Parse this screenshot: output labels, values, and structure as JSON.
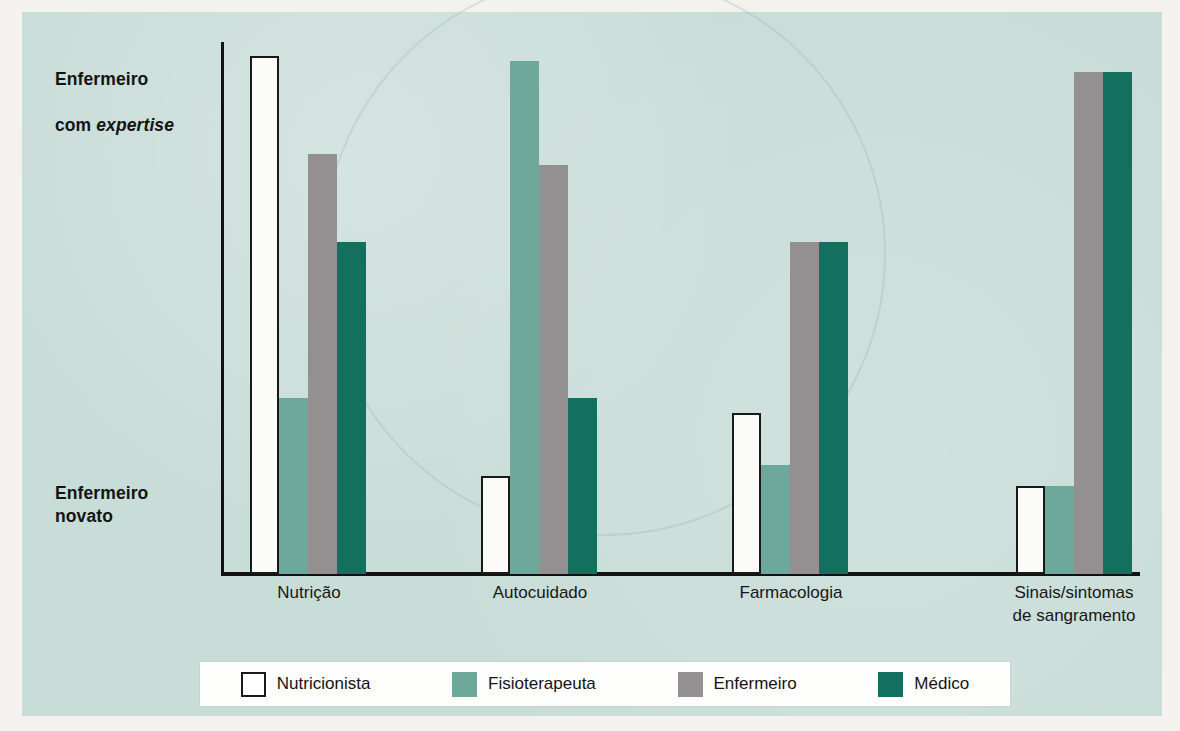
{
  "axis": {
    "top_label_line1": "Enfermeiro",
    "top_label_line2_prefix": "com ",
    "top_label_line2_italic": "expertise",
    "bottom_label": "Enfermeiro\nnovato"
  },
  "legend": {
    "items": [
      {
        "label": "Nutricionista",
        "color": "#ffffff",
        "swatch": "outlined-white"
      },
      {
        "label": "Fisioterapeuta",
        "color": "#6da89b",
        "swatch": "filled"
      },
      {
        "label": "Enfermeiro",
        "color": "#949091",
        "swatch": "filled"
      },
      {
        "label": "Médico",
        "color": "#14705e",
        "swatch": "filled"
      }
    ]
  },
  "colors": {
    "panel_background": "#c9ddd8",
    "page_background": "#f4f2ef",
    "axis": "#121212",
    "series_nutricionista": "#ffffff",
    "series_fisioterapeuta": "#6da89b",
    "series_enfermeiro": "#949091",
    "series_medico": "#14705e"
  },
  "chart_data": {
    "type": "bar",
    "title": "",
    "xlabel": "",
    "ylabel": "Enfermeiro novato → Enfermeiro com expertise",
    "categories": [
      "Nutrição",
      "Autocuidado",
      "Farmacologia",
      "Sinais/sintomas\nde sangramento"
    ],
    "ylim": [
      0,
      100
    ],
    "y_axis_ticks": [
      "Enfermeiro novato",
      "Enfermeiro com expertise"
    ],
    "grid": false,
    "legend_position": "bottom",
    "series": [
      {
        "name": "Nutricionista",
        "color": "#ffffff",
        "values": [
          100,
          19,
          31,
          17
        ]
      },
      {
        "name": "Fisioterapeuta",
        "color": "#6da89b",
        "values": [
          34,
          99,
          21,
          17
        ]
      },
      {
        "name": "Enfermeiro",
        "color": "#949091",
        "values": [
          81,
          79,
          64,
          97
        ]
      },
      {
        "name": "Médico",
        "color": "#14705e",
        "values": [
          64,
          34,
          64,
          97
        ]
      }
    ]
  },
  "bleed_through": {
    "left_text": "",
    "right_text": ""
  }
}
